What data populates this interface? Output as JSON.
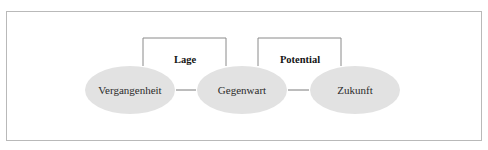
{
  "figure": {
    "border_color": "#b9b9b9",
    "background_color": "#ffffff"
  },
  "diagram": {
    "node_fill_color": "#e2e2e2",
    "line_color": "#8a8a8a",
    "text_color": "#2b2b2b",
    "nodes": [
      {
        "id": "past",
        "label": "Vergangenheit",
        "cx": 130,
        "cy": 90,
        "rx": 45,
        "ry": 24
      },
      {
        "id": "present",
        "label": "Gegenwart",
        "cx": 242,
        "cy": 90,
        "rx": 45,
        "ry": 24
      },
      {
        "id": "future",
        "label": "Zukunft",
        "cx": 355,
        "cy": 90,
        "rx": 45,
        "ry": 24
      }
    ],
    "connectors": [
      {
        "id": "past-present",
        "x1": 176,
        "x2": 196,
        "y": 90
      },
      {
        "id": "present-future",
        "x1": 288,
        "x2": 309,
        "y": 90
      }
    ],
    "brackets": [
      {
        "id": "lage",
        "label": "Lage",
        "left": 143,
        "right": 226,
        "top": 38,
        "bottom": 66,
        "label_x": 185,
        "label_y": 61
      },
      {
        "id": "potential",
        "label": "Potential",
        "left": 258,
        "right": 341,
        "top": 38,
        "bottom": 66,
        "label_x": 300,
        "label_y": 61
      }
    ]
  }
}
